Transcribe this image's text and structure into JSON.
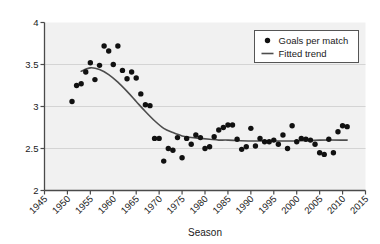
{
  "chart_data": {
    "type": "scatter",
    "title": "",
    "xlabel": "Season",
    "ylabel": "",
    "xlim": [
      1945,
      2015
    ],
    "ylim": [
      2,
      4
    ],
    "xticks": [
      1945,
      1950,
      1955,
      1960,
      1965,
      1970,
      1975,
      1980,
      1985,
      1990,
      1995,
      2000,
      2005,
      2010,
      2015
    ],
    "xticklabels": [
      "1945",
      "1950",
      "1955",
      "1960",
      "1965",
      "1970",
      "1975",
      "1980",
      "1985",
      "1990",
      "1995",
      "2000",
      "2005",
      "2010",
      "2015"
    ],
    "yticks": [
      2,
      2.5,
      3,
      3.5,
      4
    ],
    "yticklabels": [
      "2",
      "2.5",
      "3",
      "3.5",
      "4"
    ],
    "grid": true,
    "grid_axis": "y",
    "legend_position": "upper right",
    "plot_bgcolor": "#f1f1f1",
    "grid_color": "#d0d0d0",
    "marker_color": "#111111",
    "trend_color": "#4d4d4d",
    "legend": [
      {
        "label": "Goals per match",
        "marker": "circle",
        "color": "#111111"
      },
      {
        "label": "Fitted trend",
        "marker": "line",
        "color": "#4d4d4d"
      }
    ],
    "series": [
      {
        "name": "Goals per match",
        "type": "scatter",
        "x": [
          1951,
          1952,
          1953,
          1954,
          1955,
          1956,
          1957,
          1958,
          1959,
          1960,
          1961,
          1962,
          1963,
          1964,
          1965,
          1966,
          1967,
          1968,
          1969,
          1970,
          1971,
          1972,
          1973,
          1974,
          1975,
          1976,
          1977,
          1978,
          1979,
          1980,
          1981,
          1982,
          1983,
          1984,
          1985,
          1986,
          1987,
          1988,
          1989,
          1990,
          1991,
          1992,
          1993,
          1994,
          1995,
          1996,
          1997,
          1998,
          1999,
          2000,
          2001,
          2002,
          2003,
          2004,
          2005,
          2006,
          2007,
          2008,
          2009,
          2010,
          2011
        ],
        "y": [
          3.06,
          3.25,
          3.27,
          3.41,
          3.52,
          3.32,
          3.49,
          3.72,
          3.66,
          3.5,
          3.72,
          3.43,
          3.33,
          3.41,
          3.34,
          3.15,
          3.02,
          3.01,
          2.62,
          2.62,
          2.35,
          2.5,
          2.48,
          2.63,
          2.39,
          2.62,
          2.55,
          2.66,
          2.63,
          2.5,
          2.52,
          2.64,
          2.72,
          2.75,
          2.78,
          2.78,
          2.61,
          2.49,
          2.52,
          2.74,
          2.53,
          2.62,
          2.58,
          2.58,
          2.6,
          2.55,
          2.66,
          2.5,
          2.77,
          2.58,
          2.62,
          2.61,
          2.6,
          2.55,
          2.45,
          2.43,
          2.61,
          2.45,
          2.7,
          2.77,
          2.76
        ]
      },
      {
        "name": "Fitted trend",
        "type": "line",
        "x": [
          1953,
          1955,
          1957,
          1959,
          1961,
          1963,
          1965,
          1967,
          1969,
          1971,
          1973,
          1975,
          1977,
          1979,
          1981,
          1983,
          1985,
          1990,
          1995,
          2000,
          2005,
          2011
        ],
        "y": [
          3.42,
          3.46,
          3.44,
          3.38,
          3.29,
          3.18,
          3.06,
          2.94,
          2.83,
          2.74,
          2.69,
          2.65,
          2.63,
          2.62,
          2.61,
          2.6,
          2.6,
          2.59,
          2.59,
          2.59,
          2.6,
          2.6
        ]
      }
    ]
  }
}
